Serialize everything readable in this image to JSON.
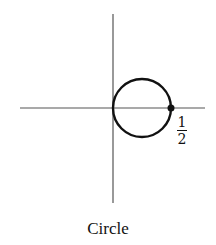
{
  "figure": {
    "caption": "Circle",
    "label_fraction": {
      "numerator": "1",
      "denominator": "2"
    },
    "colors": {
      "axis": "#555555",
      "curve": "#111111",
      "point": "#111111",
      "background": "#ffffff"
    },
    "geometry": {
      "x_axis": {
        "x1": 20,
        "x2": 205,
        "y": 108
      },
      "y_axis": {
        "x": 113,
        "y1": 14,
        "y2": 203
      },
      "circle": {
        "cx": 142,
        "cy": 108,
        "r": 29
      },
      "point": {
        "cx": 171,
        "cy": 108,
        "r": 3.5
      }
    }
  }
}
